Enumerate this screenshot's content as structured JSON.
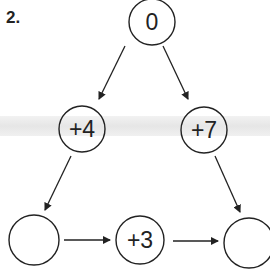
{
  "problem": {
    "number": "2."
  },
  "nodes": {
    "top": "0",
    "mid_left": "+4",
    "mid_right": "+7",
    "bottom_left": "",
    "bottom_mid": "+3",
    "bottom_right": ""
  },
  "colors": {
    "ink": "#222222",
    "band": "#e8e8e8"
  }
}
